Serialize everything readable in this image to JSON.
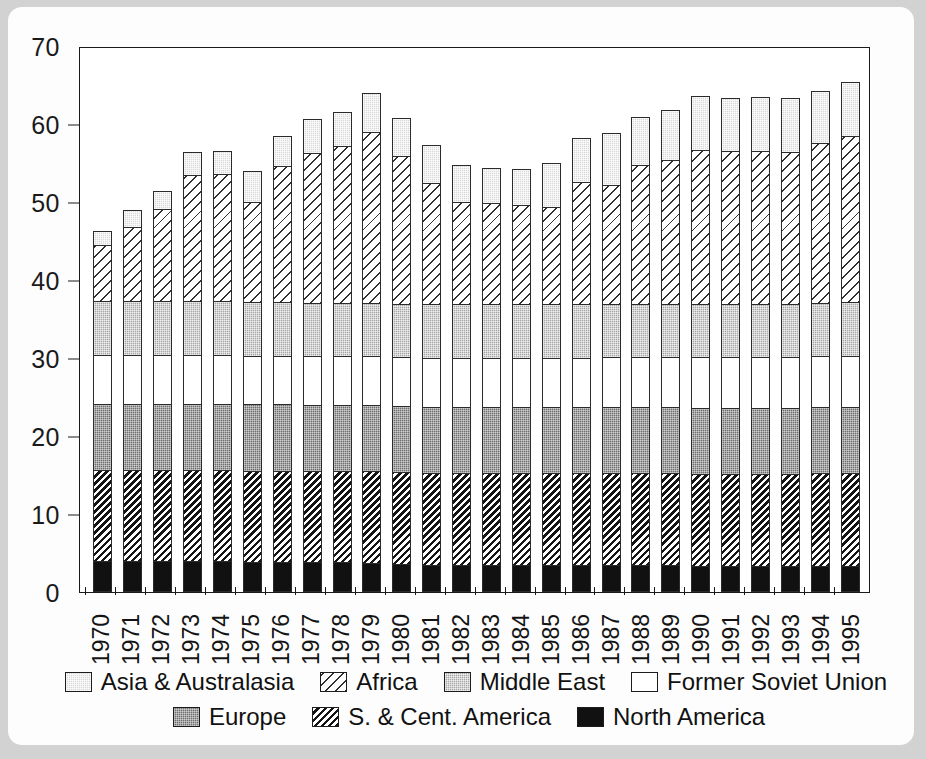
{
  "chart_data": {
    "type": "bar",
    "subtype": "stacked-vertical",
    "title": "",
    "xlabel": "",
    "ylabel": "",
    "ylim": [
      0,
      70
    ],
    "yticks": [
      0,
      10,
      20,
      30,
      40,
      50,
      60,
      70
    ],
    "grid": false,
    "legend_position": "bottom",
    "categories": [
      "1970",
      "1971",
      "1972",
      "1973",
      "1974",
      "1975",
      "1976",
      "1977",
      "1978",
      "1979",
      "1980",
      "1981",
      "1982",
      "1983",
      "1984",
      "1985",
      "1986",
      "1987",
      "1988",
      "1989",
      "1990",
      "1991",
      "1992",
      "1993",
      "1994",
      "1995"
    ],
    "series": [
      {
        "name": "North America",
        "fill": "solid-black",
        "values": [
          4.0,
          4.0,
          4.0,
          4.0,
          4.0,
          3.9,
          3.9,
          3.8,
          3.8,
          3.7,
          3.6,
          3.5,
          3.5,
          3.5,
          3.5,
          3.5,
          3.4,
          3.4,
          3.4,
          3.4,
          3.3,
          3.3,
          3.3,
          3.3,
          3.3,
          3.3
        ]
      },
      {
        "name": "S. & Cent. America",
        "fill": "dense-diagonal-hatch",
        "values": [
          11.8,
          11.8,
          11.8,
          11.8,
          11.8,
          11.8,
          11.8,
          11.8,
          11.8,
          11.9,
          11.9,
          11.9,
          11.9,
          11.9,
          11.9,
          11.9,
          12.0,
          12.0,
          12.0,
          12.0,
          12.0,
          12.0,
          12.0,
          12.0,
          12.1,
          12.1
        ]
      },
      {
        "name": "Europe",
        "fill": "dark-gray-stipple",
        "values": [
          8.6,
          8.6,
          8.6,
          8.6,
          8.6,
          8.6,
          8.6,
          8.6,
          8.6,
          8.6,
          8.6,
          8.6,
          8.6,
          8.6,
          8.6,
          8.6,
          8.6,
          8.6,
          8.6,
          8.6,
          8.6,
          8.6,
          8.6,
          8.6,
          8.6,
          8.6
        ]
      },
      {
        "name": "Former Soviet Union",
        "fill": "white",
        "values": [
          6.4,
          6.4,
          6.4,
          6.4,
          6.4,
          6.4,
          6.4,
          6.4,
          6.4,
          6.4,
          6.4,
          6.4,
          6.4,
          6.4,
          6.4,
          6.4,
          6.4,
          6.5,
          6.5,
          6.5,
          6.6,
          6.6,
          6.6,
          6.6,
          6.6,
          6.7
        ]
      },
      {
        "name": "Middle East",
        "fill": "medium-gray-stipple",
        "values": [
          7.0,
          7.0,
          7.0,
          7.0,
          7.0,
          7.0,
          7.0,
          7.0,
          7.0,
          7.0,
          7.0,
          7.0,
          7.0,
          7.0,
          7.0,
          7.0,
          7.0,
          7.0,
          7.0,
          7.0,
          7.0,
          7.0,
          7.0,
          7.0,
          7.0,
          7.0
        ]
      },
      {
        "name": "Africa",
        "fill": "light-diagonal-hatch",
        "values": [
          7.3,
          9.7,
          11.9,
          16.3,
          16.4,
          13.0,
          17.5,
          19.3,
          20.2,
          22.0,
          19.0,
          15.7,
          13.2,
          13.1,
          12.8,
          12.6,
          15.8,
          15.3,
          17.9,
          18.5,
          19.8,
          19.7,
          19.7,
          19.6,
          20.6,
          21.4
        ]
      },
      {
        "name": "Asia & Australasia",
        "fill": "light-gray-stipple",
        "values": [
          1.9,
          2.2,
          2.5,
          3.1,
          3.1,
          4.0,
          4.1,
          4.5,
          4.5,
          5.2,
          5.1,
          5.0,
          4.9,
          4.6,
          4.8,
          5.8,
          5.8,
          6.8,
          6.3,
          6.6,
          7.1,
          6.9,
          7.0,
          7.0,
          6.8,
          7.1
        ]
      }
    ],
    "totals": [
      47.0,
      49.7,
      52.2,
      57.2,
      57.3,
      54.7,
      59.3,
      61.4,
      62.3,
      64.8,
      61.6,
      58.2,
      56.0,
      55.1,
      56.5,
      55.8,
      59.0,
      59.6,
      61.7,
      62.6,
      64.3,
      63.9,
      64.2,
      64.1,
      64.9,
      66.2
    ]
  },
  "axis": {
    "y_ticks": [
      "0",
      "10",
      "20",
      "30",
      "40",
      "50",
      "60",
      "70"
    ]
  },
  "legend": {
    "rows": [
      [
        {
          "label": "Asia & Australasia",
          "fill_class": "f-asia",
          "name": "asia-australasia"
        },
        {
          "label": "Africa",
          "fill_class": "f-africa",
          "name": "africa"
        },
        {
          "label": "Middle East",
          "fill_class": "f-mideast",
          "name": "middle-east"
        },
        {
          "label": "Former Soviet Union",
          "fill_class": "f-fsu",
          "name": "former-soviet-union"
        }
      ],
      [
        {
          "label": "Europe",
          "fill_class": "f-europe",
          "name": "europe"
        },
        {
          "label": "S. & Cent. America",
          "fill_class": "f-scam",
          "name": "s-and-cent-america"
        },
        {
          "label": "North America",
          "fill_class": "f-north",
          "name": "north-america"
        }
      ]
    ]
  },
  "colors": {
    "axis": "#1a1a1a",
    "page_background": "#d2d2d2",
    "card_background": "#fdfdfd",
    "north_america": "#111111",
    "europe": "#6e6e6e",
    "middle_east": "#a5a5a5",
    "asia_australasia": "#d8d8d8",
    "former_soviet_union": "#ffffff"
  }
}
